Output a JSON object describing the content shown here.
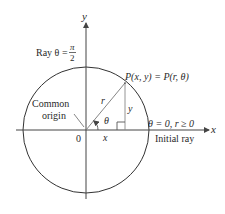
{
  "diagram": {
    "colors": {
      "background": "#ffffff",
      "ink": "#2a2a2a",
      "line": "#444444",
      "light_line": "#888888"
    },
    "axes": {
      "x_label": "x",
      "y_label": "y",
      "origin_label": "0"
    },
    "circle": {
      "cx": 86,
      "cy": 130,
      "r": 63
    },
    "point": {
      "label_prefix": "P",
      "label": "P(x, y) = P(r, θ)",
      "x": 125,
      "y": 83
    },
    "labels": {
      "r": "r",
      "y_segment": "y",
      "x_segment": "x",
      "theta": "θ",
      "ray_top": "Ray θ =",
      "pi": "π",
      "two": "2",
      "common_origin_line1": "Common",
      "common_origin_line2": "origin",
      "initial_condition": "θ = 0, r ≥ 0",
      "initial_ray": "Initial ray"
    }
  }
}
